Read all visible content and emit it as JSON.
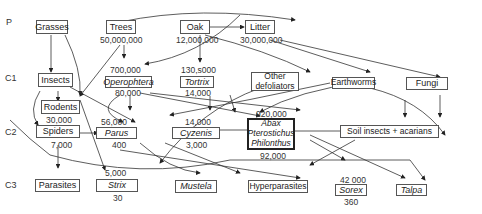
{
  "levels": {
    "p": "P",
    "c1": "C1",
    "c2": "C2",
    "c3": "C3"
  },
  "nodes": {
    "grasses": {
      "label": "Grasses"
    },
    "trees": {
      "label": "Trees",
      "below": "50,000,000"
    },
    "oak": {
      "label": "Oak",
      "below": "12,000,000"
    },
    "litter": {
      "label": "Litter",
      "below": "30,000,000"
    },
    "insects": {
      "label": "Insects"
    },
    "operophtera": {
      "label": "Operophtera",
      "above": "700,000",
      "below": "80,000"
    },
    "tortrix": {
      "label": "Tortrix",
      "above": "130,s000",
      "below": "14,000"
    },
    "other_defoliators": {
      "line1": "Other",
      "line2": "defoliators"
    },
    "earthworms": {
      "label": "Earthworms"
    },
    "fungi": {
      "label": "Fungi"
    },
    "rodents": {
      "label": "Rodents",
      "below": "30,000"
    },
    "spiders": {
      "label": "Spiders",
      "below": "7,000"
    },
    "parus": {
      "label": "Parus",
      "above": "56,000",
      "below": "400"
    },
    "cyzenis": {
      "label": "Cyzenis",
      "above": "14,000",
      "below": "3,000"
    },
    "carabids": {
      "line1": "Abax",
      "line2": "Pterostichus",
      "line3": "Philonthus",
      "above": "920,000",
      "below": "92,000"
    },
    "soil_insects": {
      "label": "Soil insects + acarians"
    },
    "parasites": {
      "label": "Parasites"
    },
    "strix": {
      "label": "Strix",
      "above": "5,000",
      "below": "30"
    },
    "mustela": {
      "label": "Mustela"
    },
    "hyperparasites": {
      "label": "Hyperparasites"
    },
    "sorex": {
      "label": "Sorex",
      "above": "42 000",
      "below": "360"
    },
    "talpa": {
      "label": "Talpa"
    }
  }
}
